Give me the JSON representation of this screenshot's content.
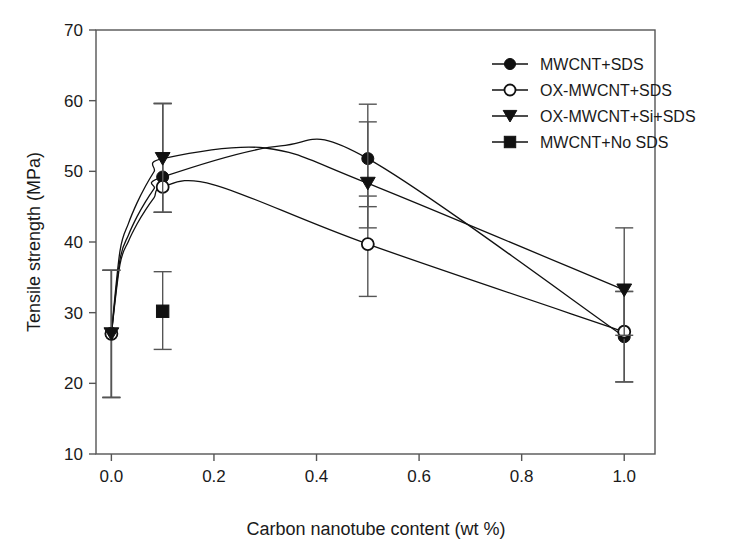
{
  "chart_data": {
    "type": "line",
    "title": "",
    "xlabel": "Carbon nanotube content (wt %)",
    "ylabel": "Tensile strength (MPa)",
    "xlim": [
      -0.03,
      1.06
    ],
    "ylim": [
      10,
      70
    ],
    "xticks": [
      "0.0",
      "0.2",
      "0.4",
      "0.6",
      "0.8",
      "1.0"
    ],
    "xtick_values": [
      0.0,
      0.2,
      0.4,
      0.6,
      0.8,
      1.0
    ],
    "yticks": [
      "10",
      "20",
      "30",
      "40",
      "50",
      "60",
      "70"
    ],
    "ytick_values": [
      10,
      20,
      30,
      40,
      50,
      60,
      70
    ],
    "grid": false,
    "legend_position": "top-right",
    "series": [
      {
        "name": "MWCNT+SDS",
        "marker": "filled-circle",
        "x": [
          0.0,
          0.1,
          0.5,
          1.0
        ],
        "values": [
          27.0,
          49.2,
          51.8,
          26.6
        ],
        "err_low": [
          18.0,
          44.2,
          45.0,
          20.2
        ],
        "err_high": [
          36.0,
          59.6,
          59.5,
          33.0
        ]
      },
      {
        "name": "OX-MWCNT+SDS",
        "marker": "open-circle",
        "x": [
          0.0,
          0.1,
          0.5,
          1.0
        ],
        "values": [
          27.0,
          47.8,
          39.7,
          27.3
        ],
        "err_low": [
          18.0,
          44.2,
          32.3,
          20.2
        ],
        "err_high": [
          36.0,
          59.6,
          46.5,
          33.0
        ]
      },
      {
        "name": "OX-MWCNT+Si+SDS",
        "marker": "filled-triangle",
        "x": [
          0.0,
          0.1,
          0.5,
          1.0
        ],
        "values": [
          27.0,
          51.8,
          48.3,
          33.2
        ],
        "err_low": [
          18.0,
          44.2,
          42.0,
          26.8
        ],
        "err_high": [
          36.0,
          59.6,
          57.0,
          42.0
        ]
      },
      {
        "name": "MWCNT+No SDS",
        "marker": "filled-square",
        "x": [
          0.1
        ],
        "values": [
          30.2
        ],
        "err_low": [
          24.8
        ],
        "err_high": [
          35.8
        ]
      }
    ],
    "curve_peaks": {
      "MWCNT+SDS": {
        "x": 0.33,
        "y": 53.6
      },
      "OX-MWCNT+SDS": {
        "x": 0.2,
        "y": 48.1
      },
      "OX-MWCNT+Si+SDS": {
        "x": 0.3,
        "y": 53.3
      }
    }
  },
  "legend": {
    "entries": [
      {
        "label": "MWCNT+SDS",
        "marker": "filled-circle"
      },
      {
        "label": "OX-MWCNT+SDS",
        "marker": "open-circle"
      },
      {
        "label": "OX-MWCNT+Si+SDS",
        "marker": "filled-triangle"
      },
      {
        "label": "MWCNT+No SDS",
        "marker": "filled-square"
      }
    ]
  },
  "colors": {
    "axis": "#555555",
    "data": "#111111",
    "background": "#ffffff"
  }
}
